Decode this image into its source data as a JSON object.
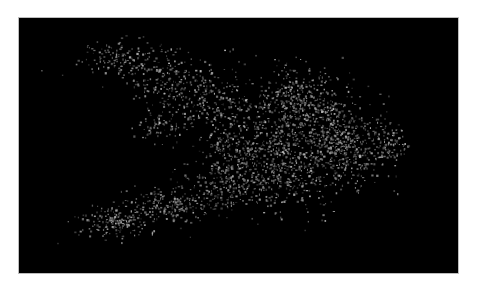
{
  "chart_data": {
    "type": "scatter",
    "title": "",
    "xlabel": "",
    "ylabel": "",
    "grid": false,
    "legend": null,
    "axes_visible": false,
    "background_color": "#000000",
    "point_color_range": [
      "#3a3a3a",
      "#bdbdbd"
    ],
    "panel": {
      "x": 18,
      "y": 17,
      "width": 441,
      "height": 257
    },
    "clusters": [
      {
        "name": "upper-left-arm-tip",
        "cx": 120,
        "cy": 55,
        "sx": 20,
        "sy": 10,
        "n": 140
      },
      {
        "name": "upper-left-arm",
        "cx": 165,
        "cy": 75,
        "sx": 22,
        "sy": 14,
        "n": 160
      },
      {
        "name": "upper-arm-mid",
        "cx": 205,
        "cy": 100,
        "sx": 25,
        "sy": 16,
        "n": 220
      },
      {
        "name": "left-mid-islands",
        "cx": 155,
        "cy": 125,
        "sx": 12,
        "sy": 8,
        "n": 60
      },
      {
        "name": "core-left",
        "cx": 240,
        "cy": 150,
        "sx": 28,
        "sy": 25,
        "n": 380
      },
      {
        "name": "core-center",
        "cx": 300,
        "cy": 135,
        "sx": 32,
        "sy": 30,
        "n": 620
      },
      {
        "name": "core-upper",
        "cx": 300,
        "cy": 95,
        "sx": 22,
        "sy": 15,
        "n": 220
      },
      {
        "name": "core-right",
        "cx": 345,
        "cy": 145,
        "sx": 22,
        "sy": 20,
        "n": 380
      },
      {
        "name": "right-tip",
        "cx": 390,
        "cy": 143,
        "sx": 8,
        "sy": 9,
        "n": 80
      },
      {
        "name": "right-tip-outlier",
        "cx": 404,
        "cy": 147,
        "sx": 3,
        "sy": 3,
        "n": 12
      },
      {
        "name": "lower-band",
        "cx": 250,
        "cy": 185,
        "sx": 35,
        "sy": 12,
        "n": 300
      },
      {
        "name": "lower-left-tail-mid",
        "cx": 170,
        "cy": 205,
        "sx": 22,
        "sy": 9,
        "n": 200
      },
      {
        "name": "lower-left-tail-end",
        "cx": 118,
        "cy": 222,
        "sx": 20,
        "sy": 8,
        "n": 180
      }
    ],
    "seed": 1234567
  }
}
